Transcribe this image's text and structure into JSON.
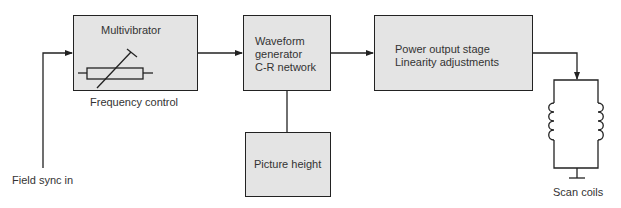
{
  "diagram": {
    "type": "block-diagram",
    "blocks": {
      "multivibrator": {
        "label": "Multivibrator",
        "caption": "Frequency control"
      },
      "waveform": {
        "line1": "Waveform",
        "line2": "generator",
        "line3": "C-R network"
      },
      "picture_height": {
        "label": "Picture height"
      },
      "power": {
        "line1": "Power output stage",
        "line2": "Linearity adjustments"
      }
    },
    "labels": {
      "input": "Field sync in",
      "output": "Scan coils"
    },
    "colors": {
      "block_fill": "#e4e4e4",
      "line": "#222222"
    }
  }
}
